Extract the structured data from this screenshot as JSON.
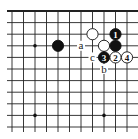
{
  "diagram": {
    "type": "go-board-partial",
    "region": "top edge section",
    "grid": {
      "origin_x": 12,
      "origin_y": 11,
      "spacing_x": 11.5,
      "spacing_y": 11.6,
      "cols": 12,
      "rows": 11,
      "top_edge": true,
      "line_color": "#222222",
      "edge_color": "#111111"
    },
    "star_points": [
      {
        "col": 2,
        "row": 3
      },
      {
        "col": 2,
        "row": 9
      },
      {
        "col": 8,
        "row": 9
      }
    ],
    "stones": [
      {
        "color": "black",
        "col": 4,
        "row": 3,
        "label": ""
      },
      {
        "color": "white",
        "col": 7,
        "row": 2,
        "label": ""
      },
      {
        "color": "black",
        "col": 9,
        "row": 2,
        "label": "1"
      },
      {
        "color": "white",
        "col": 8,
        "row": 3,
        "label": ""
      },
      {
        "color": "black",
        "col": 9,
        "row": 3,
        "label": ""
      },
      {
        "color": "black",
        "col": 8,
        "row": 4,
        "label": "3"
      },
      {
        "color": "white",
        "col": 9,
        "row": 4,
        "label": "2"
      },
      {
        "color": "white",
        "col": 10,
        "row": 4,
        "label": "4"
      }
    ],
    "letter_marks": [
      {
        "label": "a",
        "col": 6,
        "row": 3
      },
      {
        "label": "c",
        "col": 7,
        "row": 4
      },
      {
        "label": "b",
        "col": 8,
        "row": 5
      }
    ],
    "colors": {
      "black_stone": "#111111",
      "white_stone": "#ffffff",
      "stone_outline": "#111111",
      "background": "#ffffff"
    }
  }
}
